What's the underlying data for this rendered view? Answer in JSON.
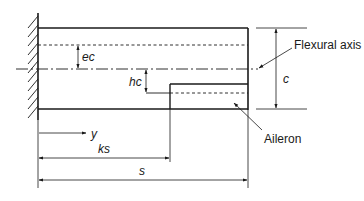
{
  "diagram": {
    "labels": {
      "flexural_axis": "Flexural axis",
      "aileron": "Aileron",
      "ec": "ec",
      "hc": "hc",
      "c": "c",
      "y": "y",
      "ks": "ks",
      "s": "s"
    },
    "colors": {
      "line": "#1a1a1a",
      "background": "#ffffff"
    }
  }
}
